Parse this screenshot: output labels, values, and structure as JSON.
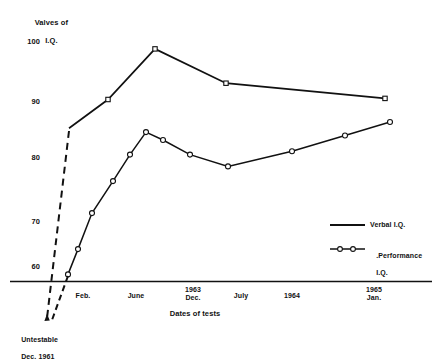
{
  "chart_data": {
    "type": "line",
    "title": "",
    "ylabel": "Valves of\nI.Q.",
    "ylabel_line1": "Valves of",
    "ylabel_line2": "I.Q.",
    "xlabel": "Dates of tests",
    "ylim": [
      55,
      102
    ],
    "yticks": [
      100,
      90,
      80,
      70,
      60
    ],
    "ytick_labels": [
      "100",
      "90",
      "80",
      "70",
      "60"
    ],
    "grid": false,
    "legend_position": "right-middle",
    "xtick_labels": [
      "Feb.",
      "June",
      "1963\nDec.",
      "July",
      "1964",
      "1965\nJan."
    ],
    "xticks": [
      {
        "label": "Feb.",
        "line1": "Feb.",
        "line2": "",
        "x": 83
      },
      {
        "label": "June",
        "line1": "June",
        "line2": "",
        "x": 136
      },
      {
        "label": "1963 Dec.",
        "line1": "1963",
        "line2": "Dec.",
        "x": 193
      },
      {
        "label": "July",
        "line1": "July",
        "line2": "",
        "x": 241
      },
      {
        "label": "1964",
        "line1": "1964",
        "line2": "",
        "x": 292
      },
      {
        "label": "1965 Jan.",
        "line1": "1965",
        "line2": "Jan.",
        "x": 374
      }
    ],
    "series": [
      {
        "name": "Verbal I.Q.",
        "marker": "square",
        "style": "solid",
        "leading_dashed_segment": true,
        "x": [
          69,
          108,
          155,
          226,
          385
        ],
        "values": [
          84.5,
          89.6,
          98.6,
          92.5,
          89.8
        ]
      },
      {
        "name": "Performance I.Q.",
        "marker": "circle",
        "style": "solid",
        "leading_dashed_segment": true,
        "x": [
          68,
          78,
          92,
          113,
          130,
          146,
          163,
          190,
          228,
          292,
          345,
          390
        ],
        "values": [
          58.5,
          63.0,
          69.4,
          75.1,
          79.8,
          83.8,
          82.4,
          79.8,
          77.7,
          80.4,
          83.2,
          85.6
        ]
      }
    ],
    "annotations": [
      {
        "name": "untestable-note",
        "line1": "Untestable",
        "line2": "Dec. 1961"
      }
    ]
  },
  "legend": {
    "items": [
      {
        "label_line1": "Verbal I.Q.",
        "label_line2": "",
        "marker": "line"
      },
      {
        "label_line1": ".Performance",
        "label_line2": "I.Q.",
        "marker": "line-circles"
      }
    ]
  },
  "colors": {
    "ink": "#111111",
    "background": "#ffffff",
    "marker_fill": "#ffffff"
  }
}
